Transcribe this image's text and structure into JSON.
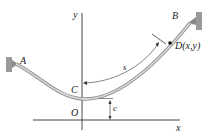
{
  "diagram": {
    "type": "catenary-cable",
    "labels": {
      "y_axis": "y",
      "x_axis": "x",
      "origin": "O",
      "lowest_point": "C",
      "support_left": "A",
      "support_right": "B",
      "point_d": "D(x,y)",
      "arc_length": "s",
      "height_c": "c"
    },
    "colors": {
      "cable": "#b9b9b9",
      "cable_edge": "#8a8a8a",
      "axes": "#333333",
      "support": "#9a9a9a",
      "support_dark": "#777777",
      "text": "#222222"
    }
  }
}
